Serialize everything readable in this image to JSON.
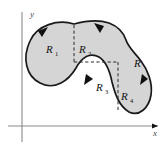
{
  "figure": {
    "background_color": "#ffffff",
    "region_fill_color": "#d5d5d5",
    "region_stroke_color": "#1a1a1a",
    "axis_color": "#8a8a8a",
    "divider_color": "#2a2a2a"
  },
  "axes": {
    "x_label": "x",
    "y_label": "y",
    "x_axis_y": 126,
    "y_axis_x": 22,
    "x_axis_start": 8,
    "x_axis_end": 158,
    "y_axis_start": 12,
    "y_axis_end": 142
  },
  "region_labels": [
    {
      "name": "R1",
      "base": "R",
      "subscript": "1",
      "x": 50,
      "y": 50
    },
    {
      "name": "R2",
      "base": "R",
      "subscript": "2",
      "x": 84,
      "y": 50
    },
    {
      "name": "R3",
      "base": "R",
      "subscript": "3",
      "x": 100,
      "y": 88
    },
    {
      "name": "R4",
      "base": "R",
      "subscript": "4",
      "x": 125,
      "y": 97
    },
    {
      "name": "R",
      "base": "R",
      "subscript": "",
      "x": 137,
      "y": 64
    }
  ],
  "dividers": [
    {
      "name": "vertical-divider-upper",
      "x1": 74,
      "y1": 25,
      "x2": 74,
      "y2": 62
    },
    {
      "name": "horizontal-divider",
      "x1": 74,
      "y1": 62,
      "x2": 118,
      "y2": 62
    },
    {
      "name": "vertical-divider-lower",
      "x1": 118,
      "y1": 62,
      "x2": 118,
      "y2": 112
    }
  ],
  "orientation_arrows": [
    {
      "name": "arrow-upper-left",
      "direction": "down-left"
    },
    {
      "name": "arrow-upper-right",
      "direction": "right"
    },
    {
      "name": "arrow-middle-left",
      "direction": "down-left"
    },
    {
      "name": "arrow-right-side",
      "direction": "up"
    }
  ],
  "region_outline_path": "M 74 24 C 58 20 38 26 31 42 C 24 58 27 74 40 81 C 54 89 68 80 75 68 C 81 57 89 52 98 56 C 106 60 110 70 112 80 C 115 92 118 104 128 110 C 138 116 148 108 150 96 C 152 83 146 70 140 62 C 134 54 128 48 126 41 C 124 33 118 27 110 24 C 98 20 86 21 74 24 Z"
}
